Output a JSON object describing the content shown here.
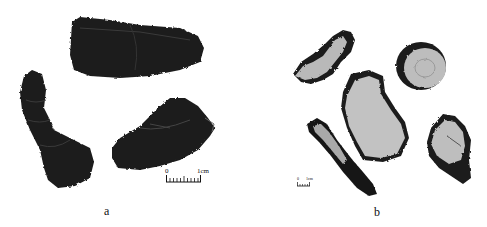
{
  "figure": {
    "panels": [
      {
        "label": "a",
        "description": "Three dark, dried, wrinkled cylindrical specimens",
        "scale_bar": {
          "start": "0",
          "end": "1cm"
        }
      },
      {
        "label": "b",
        "description": "Five cross-section slices with pale interior and dark rim",
        "scale_bar": {
          "start": "0",
          "end": "1cm"
        }
      }
    ]
  }
}
